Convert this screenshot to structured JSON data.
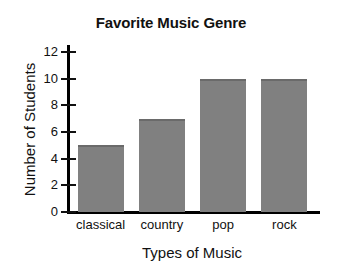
{
  "chart_data": {
    "type": "bar",
    "title": "Favorite Music Genre",
    "xlabel": "Types of Music",
    "ylabel": "Number of Students",
    "categories": [
      "classical",
      "country",
      "pop",
      "rock"
    ],
    "values": [
      5,
      7,
      10,
      10
    ],
    "ylim": [
      0,
      12
    ],
    "ytick_values": [
      0,
      2,
      4,
      6,
      8,
      10,
      12
    ],
    "ytick_labels": [
      "0",
      "2",
      "4",
      "6",
      "8",
      "10",
      "12"
    ],
    "grid": false,
    "legend": false,
    "bar_color": "#808080",
    "axis_color": "#000000",
    "background_color": "#ffffff"
  }
}
